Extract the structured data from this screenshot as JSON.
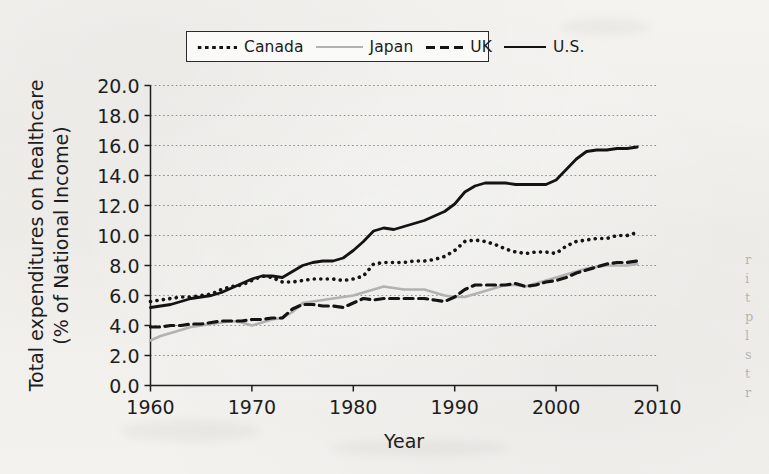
{
  "legend": {
    "position": "top-center",
    "entries": [
      {
        "label": "Canada",
        "style": "dotted",
        "color": "#141414",
        "icon": "dotted-line-swatch"
      },
      {
        "label": "Japan",
        "style": "solid",
        "color": "#b2b2b2",
        "icon": "solid-line-swatch"
      },
      {
        "label": "UK",
        "style": "dashed",
        "color": "#141414",
        "icon": "dashed-line-swatch"
      },
      {
        "label": "U.S.",
        "style": "solid",
        "color": "#131313",
        "icon": "solid-line-swatch"
      }
    ]
  },
  "axes": {
    "y_title_line1": "Total expenditures on healthcare",
    "y_title_line2": "(% of National Income)",
    "x_title": "Year",
    "y_ticks": [
      "0.0",
      "2.0",
      "4.0",
      "6.0",
      "8.0",
      "10.0",
      "12.0",
      "14.0",
      "16.0",
      "18.0",
      "20.0"
    ],
    "x_ticks": [
      "1960",
      "1970",
      "1980",
      "1990",
      "2000",
      "2010"
    ]
  },
  "margin_bleed": {
    "fragments": [
      "r",
      "i",
      "t",
      "p",
      "l",
      "s",
      "t",
      "r"
    ]
  },
  "chart_data": {
    "type": "line",
    "title": "",
    "xlabel": "Year",
    "ylabel": "Total expenditures on healthcare (% of National Income)",
    "xlim": [
      1960,
      2010
    ],
    "ylim": [
      0.0,
      20.0
    ],
    "ytick_step": 2.0,
    "xtick_step": 10,
    "grid": "horizontal-dotted",
    "legend_position": "top-center",
    "x": [
      1960,
      1961,
      1962,
      1963,
      1964,
      1965,
      1966,
      1967,
      1968,
      1969,
      1970,
      1971,
      1972,
      1973,
      1974,
      1975,
      1976,
      1977,
      1978,
      1979,
      1980,
      1981,
      1982,
      1983,
      1984,
      1985,
      1986,
      1987,
      1988,
      1989,
      1990,
      1991,
      1992,
      1993,
      1994,
      1995,
      1996,
      1997,
      1998,
      1999,
      2000,
      2001,
      2002,
      2003,
      2004,
      2005,
      2006,
      2007,
      2008
    ],
    "series": [
      {
        "name": "Canada",
        "style": "dotted",
        "color": "#141414",
        "values": [
          5.6,
          5.7,
          5.8,
          5.9,
          5.9,
          6.0,
          6.1,
          6.4,
          6.6,
          6.7,
          7.0,
          7.3,
          7.2,
          6.9,
          6.9,
          7.0,
          7.1,
          7.1,
          7.1,
          7.0,
          7.1,
          7.3,
          8.1,
          8.2,
          8.2,
          8.2,
          8.3,
          8.3,
          8.4,
          8.6,
          9.0,
          9.6,
          9.7,
          9.6,
          9.4,
          9.1,
          8.9,
          8.8,
          8.9,
          8.9,
          8.8,
          9.3,
          9.6,
          9.7,
          9.8,
          9.8,
          10.0,
          10.0,
          10.2
        ]
      },
      {
        "name": "Japan",
        "style": "solid",
        "color": "#b2b2b2",
        "values": [
          3.0,
          3.3,
          3.5,
          3.7,
          3.9,
          4.0,
          4.1,
          4.2,
          4.3,
          4.2,
          4.0,
          4.2,
          4.4,
          4.5,
          4.9,
          5.5,
          5.6,
          5.7,
          5.8,
          5.9,
          6.0,
          6.2,
          6.4,
          6.6,
          6.5,
          6.4,
          6.4,
          6.4,
          6.2,
          6.0,
          5.9,
          5.9,
          6.1,
          6.3,
          6.5,
          6.7,
          6.7,
          6.6,
          6.8,
          7.0,
          7.2,
          7.4,
          7.6,
          7.8,
          7.9,
          8.0,
          8.0,
          8.0,
          8.1
        ]
      },
      {
        "name": "UK",
        "style": "dashed",
        "color": "#141414",
        "values": [
          3.9,
          3.9,
          4.0,
          4.0,
          4.1,
          4.1,
          4.2,
          4.3,
          4.3,
          4.3,
          4.4,
          4.4,
          4.5,
          4.5,
          5.1,
          5.4,
          5.4,
          5.3,
          5.3,
          5.2,
          5.5,
          5.8,
          5.7,
          5.8,
          5.8,
          5.8,
          5.8,
          5.8,
          5.7,
          5.6,
          5.9,
          6.4,
          6.7,
          6.7,
          6.7,
          6.7,
          6.8,
          6.6,
          6.7,
          6.9,
          7.0,
          7.2,
          7.5,
          7.7,
          7.9,
          8.1,
          8.2,
          8.2,
          8.3
        ]
      },
      {
        "name": "U.S.",
        "style": "solid",
        "color": "#131313",
        "values": [
          5.2,
          5.3,
          5.4,
          5.6,
          5.8,
          5.9,
          6.0,
          6.2,
          6.5,
          6.8,
          7.1,
          7.3,
          7.3,
          7.2,
          7.6,
          8.0,
          8.2,
          8.3,
          8.3,
          8.5,
          9.0,
          9.6,
          10.3,
          10.5,
          10.4,
          10.6,
          10.8,
          11.0,
          11.3,
          11.6,
          12.1,
          12.9,
          13.3,
          13.5,
          13.5,
          13.5,
          13.4,
          13.4,
          13.4,
          13.4,
          13.7,
          14.4,
          15.1,
          15.6,
          15.7,
          15.7,
          15.8,
          15.8,
          15.9
        ]
      }
    ]
  }
}
